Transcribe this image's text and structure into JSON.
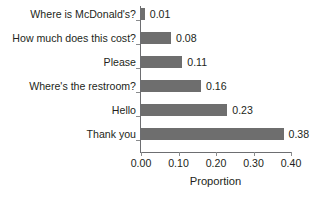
{
  "chart_data": {
    "type": "bar",
    "orientation": "horizontal",
    "title": "",
    "xlabel": "Proportion",
    "ylabel": "",
    "xlim": [
      0.0,
      0.4
    ],
    "grid": false,
    "legend": null,
    "bar_color": "#6e6e6e",
    "axis_color": "#6d6e71",
    "text_color": "#231f20",
    "categories": [
      "Where is McDonald's?",
      "How much does this cost?",
      "Please",
      "Where's the restroom?",
      "Hello",
      "Thank you"
    ],
    "values": [
      0.01,
      0.08,
      0.11,
      0.16,
      0.23,
      0.38
    ],
    "value_labels": [
      "0.01",
      "0.08",
      "0.11",
      "0.16",
      "0.23",
      "0.38"
    ],
    "xticks": [
      0.0,
      0.1,
      0.2,
      0.3,
      0.4
    ],
    "xtick_labels": [
      "0.00",
      "0.10",
      "0.20",
      "0.30",
      "0.40"
    ]
  }
}
